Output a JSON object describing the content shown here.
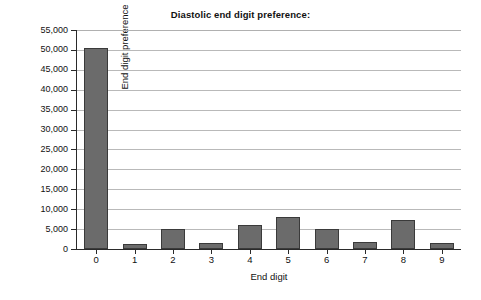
{
  "chart_data": {
    "type": "bar",
    "title": "Diastolic end digit preference:",
    "xlabel": "End digit",
    "ylabel": "End digit preference",
    "categories": [
      "0",
      "1",
      "2",
      "3",
      "4",
      "5",
      "6",
      "7",
      "8",
      "9"
    ],
    "values": [
      50400,
      1350,
      5000,
      1450,
      5950,
      8100,
      4950,
      1800,
      7350,
      1550
    ],
    "ylim": [
      0,
      55000
    ],
    "ytick_step": 5000,
    "ytick_labels": [
      "0",
      "5,000",
      "10,000",
      "15,000",
      "20,000",
      "25,000",
      "30,000",
      "35,000",
      "40,000",
      "45,000",
      "50,000",
      "55,000"
    ],
    "ytick_values": [
      0,
      5000,
      10000,
      15000,
      20000,
      25000,
      30000,
      35000,
      40000,
      45000,
      50000,
      55000
    ],
    "grid": true,
    "legend": null,
    "bar_fill_color": "#6b6b6b",
    "bar_border_color": "#3a3a3a",
    "gridline_color": "#b9b9b9",
    "axis_color": "#2a2a2a",
    "background_color": "#ffffff",
    "series": [
      {
        "name": "End digit preference",
        "values": [
          50400,
          1350,
          5000,
          1450,
          5950,
          8100,
          4950,
          1800,
          7350,
          1550
        ]
      }
    ]
  }
}
